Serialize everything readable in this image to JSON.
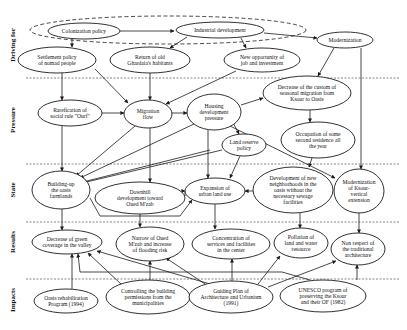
{
  "rows": [
    {
      "id": "driving",
      "label": "Driving for",
      "y": 45
    },
    {
      "id": "pressure",
      "label": "Pressure",
      "y": 120
    },
    {
      "id": "state",
      "label": "State",
      "y": 190
    },
    {
      "id": "results",
      "label": "Results",
      "y": 242
    },
    {
      "id": "impacts",
      "label": "Impacts",
      "y": 300
    }
  ],
  "dividers": [
    78,
    164,
    222,
    279
  ],
  "group": {
    "cx": 168,
    "cy": 30,
    "rx": 138,
    "ry": 14
  },
  "nodes": [
    {
      "id": "colonization",
      "lines": [
        "Colonization policy"
      ],
      "cx": 84,
      "cy": 31,
      "rx": 36,
      "ry": 8
    },
    {
      "id": "industrial",
      "lines": [
        "Industrial development"
      ],
      "cx": 220,
      "cy": 30,
      "rx": 44,
      "ry": 8
    },
    {
      "id": "modernization",
      "lines": [
        "Modernization"
      ],
      "cx": 345,
      "cy": 40,
      "rx": 28,
      "ry": 8
    },
    {
      "id": "settlement",
      "lines": [
        "Settlement policy",
        "of nomad people"
      ],
      "cx": 57,
      "cy": 60,
      "rx": 39,
      "ry": 13
    },
    {
      "id": "return",
      "lines": [
        "Return of old",
        "Ghardaia's habitants"
      ],
      "cx": 150,
      "cy": 60,
      "rx": 40,
      "ry": 13
    },
    {
      "id": "newopp",
      "lines": [
        "New opportunity of",
        "job and investment"
      ],
      "cx": 262,
      "cy": 60,
      "rx": 38,
      "ry": 12
    },
    {
      "id": "rarefication",
      "lines": [
        "Rarefication of",
        "social rule \"Ourf\""
      ],
      "cx": 70,
      "cy": 113,
      "rx": 32,
      "ry": 13
    },
    {
      "id": "migration",
      "lines": [
        "Migration",
        "flow"
      ],
      "cx": 148,
      "cy": 114,
      "rx": 24,
      "ry": 14
    },
    {
      "id": "housing",
      "lines": [
        "Housing",
        "development",
        "pressure"
      ],
      "cx": 214,
      "cy": 112,
      "rx": 27,
      "ry": 18
    },
    {
      "id": "decrease_custom",
      "lines": [
        "Decrease of the custom of",
        "seasonal migration from",
        "Ksour to Oasis"
      ],
      "cx": 307,
      "cy": 93,
      "rx": 44,
      "ry": 17
    },
    {
      "id": "occupation",
      "lines": [
        "Occupation of some",
        "second residence all",
        "the year"
      ],
      "cx": 318,
      "cy": 140,
      "rx": 37,
      "ry": 18
    },
    {
      "id": "landreserve",
      "lines": [
        "Land reserve",
        "policy"
      ],
      "cx": 244,
      "cy": 145,
      "rx": 22,
      "ry": 11
    },
    {
      "id": "buildingup",
      "lines": [
        "Building-up",
        "the oasis",
        "farmlands"
      ],
      "cx": 61,
      "cy": 190,
      "rx": 29,
      "ry": 19
    },
    {
      "id": "downhill",
      "lines": [
        "Downhill",
        "development toward",
        "Oued M'zab"
      ],
      "cx": 140,
      "cy": 198,
      "rx": 45,
      "ry": 16
    },
    {
      "id": "expansion",
      "lines": [
        "Expansion of",
        "urban land use"
      ],
      "cx": 215,
      "cy": 191,
      "rx": 30,
      "ry": 13
    },
    {
      "id": "newneighb",
      "lines": [
        "Development of new",
        "neighborhoods in the",
        "oasis without the",
        "necessary sewage",
        "facilities"
      ],
      "cx": 293,
      "cy": 190,
      "rx": 40,
      "ry": 23
    },
    {
      "id": "modksar",
      "lines": [
        "Modernization",
        "of Ksour-",
        "vertical",
        "extension"
      ],
      "cx": 359,
      "cy": 191,
      "rx": 25,
      "ry": 22
    },
    {
      "id": "greencov",
      "lines": [
        "Decrease of green",
        "coverage in the valley"
      ],
      "cx": 67,
      "cy": 242,
      "rx": 35,
      "ry": 12
    },
    {
      "id": "narrow",
      "lines": [
        "Narrow of Oued",
        "M'zab and increase",
        "of flooding risk"
      ],
      "cx": 150,
      "cy": 244,
      "rx": 34,
      "ry": 17
    },
    {
      "id": "concentration",
      "lines": [
        "Concentration of",
        "services and facilities",
        "in the center"
      ],
      "cx": 231,
      "cy": 244,
      "rx": 39,
      "ry": 15
    },
    {
      "id": "pollution",
      "lines": [
        "Pollation of",
        "land and water",
        "resource"
      ],
      "cx": 301,
      "cy": 243,
      "rx": 27,
      "ry": 15
    },
    {
      "id": "nonrespect",
      "lines": [
        "Non respect of",
        "the traditional",
        "architecture"
      ],
      "cx": 358,
      "cy": 249,
      "rx": 27,
      "ry": 16
    },
    {
      "id": "oasisrehab",
      "lines": [
        "Oasis rehabilitation",
        "Program (1994)"
      ],
      "cx": 66,
      "cy": 301,
      "rx": 32,
      "ry": 12
    },
    {
      "id": "controlling",
      "lines": [
        "Controlling the building",
        "permissions from the",
        "municipalities"
      ],
      "cx": 148,
      "cy": 297,
      "rx": 42,
      "ry": 17
    },
    {
      "id": "guiding",
      "lines": [
        "Guiding Plan of",
        "Architecture and Urbanism",
        "(1991)"
      ],
      "cx": 231,
      "cy": 297,
      "rx": 42,
      "ry": 16
    },
    {
      "id": "unesco",
      "lines": [
        "UNESCO program of",
        "preserving the Ksour",
        "and their OF (1982)"
      ],
      "cx": 323,
      "cy": 296,
      "rx": 43,
      "ry": 16
    }
  ],
  "edges": [
    {
      "d": "M120,31 L174,31"
    },
    {
      "d": "M264,33 L317,38"
    },
    {
      "d": "M72,39 L72,47"
    },
    {
      "d": "M187,37 L170,48"
    },
    {
      "d": "M241,38 L246,48"
    },
    {
      "d": "M62,73 L62,100"
    },
    {
      "d": "M95,69 L128,103"
    },
    {
      "d": "M150,73 L150,100"
    },
    {
      "d": "M236,71 L166,104"
    },
    {
      "d": "M102,113 L124,113"
    },
    {
      "d": "M172,113 L187,113"
    },
    {
      "d": "M241,105 L263,98"
    },
    {
      "d": "M334,48 L318,76"
    },
    {
      "d": "M310,110 L310,122"
    },
    {
      "d": "M361,48 L361,169"
    },
    {
      "d": "M150,128 L150,182"
    },
    {
      "d": "M62,126 L62,171"
    },
    {
      "d": "M135,126 L76,176"
    },
    {
      "d": "M194,124 L80,178"
    },
    {
      "d": "M210,150 L83,182"
    },
    {
      "d": "M222,150 L82,183 L82,183"
    },
    {
      "d": "M229,115 L239,134"
    },
    {
      "d": "M208,130 L208,178"
    },
    {
      "d": "M240,156 L230,178"
    },
    {
      "d": "M226,124 L335,178"
    },
    {
      "d": "M312,158 L309,167"
    },
    {
      "d": "M253,191 L245,191"
    },
    {
      "d": "M185,196 L185,191 L185,191"
    },
    {
      "d": "M140,214 L140,227"
    },
    {
      "d": "M62,209 L62,230"
    },
    {
      "d": "M90,198 L100,216 L180,216 L192,200"
    },
    {
      "d": "M215,204 L215,229"
    },
    {
      "d": "M300,213 L300,228"
    },
    {
      "d": "M359,213 L359,233"
    },
    {
      "d": "M72,289 L72,254"
    },
    {
      "d": "M121,284 L88,253"
    },
    {
      "d": "M150,280 L150,261"
    },
    {
      "d": "M205,284 L166,258"
    },
    {
      "d": "M232,281 L232,259"
    },
    {
      "d": "M258,284 L280,256"
    },
    {
      "d": "M268,287 L336,261"
    },
    {
      "d": "M357,280 L357,265"
    },
    {
      "d": "M310,280 L282,272 L80,272 L78,254"
    },
    {
      "d": "M210,284 L97,251"
    }
  ]
}
